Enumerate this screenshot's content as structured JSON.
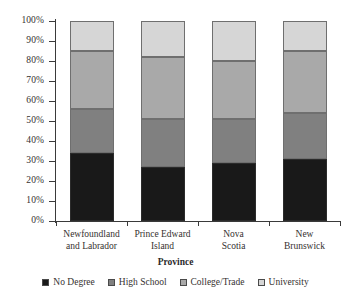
{
  "chart_data": {
    "type": "bar",
    "subtype": "stacked-percent",
    "title": "",
    "xlabel": "Province",
    "ylabel": "",
    "ylim": [
      0,
      100
    ],
    "ytick_labels": [
      "100%",
      "90%",
      "80%",
      "70%",
      "60%",
      "50%",
      "40%",
      "30%",
      "20%",
      "10%",
      "0%"
    ],
    "ytick_values": [
      100,
      90,
      80,
      70,
      60,
      50,
      40,
      30,
      20,
      10,
      0
    ],
    "grid": false,
    "legend_position": "bottom",
    "categories": [
      {
        "id": "nl",
        "lines": [
          "Newfoundland",
          "and Labrador"
        ],
        "label": "Newfoundland and Labrador"
      },
      {
        "id": "pe",
        "lines": [
          "Prince Edward",
          "Island"
        ],
        "label": "Prince Edward Island"
      },
      {
        "id": "ns",
        "lines": [
          "Nova",
          "Scotia"
        ],
        "label": "Nova Scotia"
      },
      {
        "id": "nb",
        "lines": [
          "New",
          "Brunswick"
        ],
        "label": "New Brunswick"
      }
    ],
    "series": [
      {
        "name": "No Degree",
        "color": "#191919",
        "values": [
          34,
          27,
          29,
          31
        ]
      },
      {
        "name": "High School",
        "color": "#808080",
        "values": [
          22,
          24,
          22,
          23
        ]
      },
      {
        "name": "College/Trade",
        "color": "#a9a9a9",
        "values": [
          29,
          31,
          29,
          31
        ]
      },
      {
        "name": "University",
        "color": "#d6d6d6",
        "values": [
          15,
          18,
          20,
          15
        ]
      }
    ],
    "cumulative_tops": {
      "nl": [
        34,
        56,
        85,
        100
      ],
      "pe": [
        27,
        51,
        82,
        100
      ],
      "ns": [
        29,
        51,
        80,
        100
      ],
      "nb": [
        31,
        54,
        85,
        100
      ]
    }
  },
  "legend": {
    "items": [
      {
        "label": "No Degree",
        "color": "#191919"
      },
      {
        "label": "High School",
        "color": "#808080"
      },
      {
        "label": "College/Trade",
        "color": "#a9a9a9"
      },
      {
        "label": "University",
        "color": "#d6d6d6"
      }
    ]
  },
  "axes": {
    "x_title": "Province"
  }
}
